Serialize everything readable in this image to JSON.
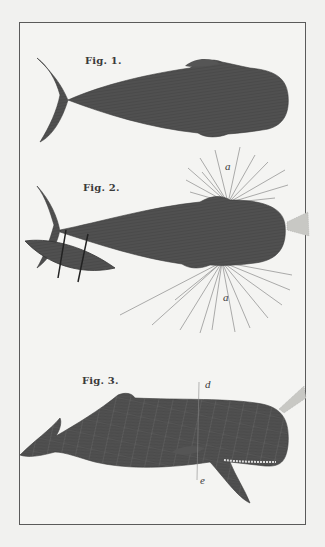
{
  "plate": {
    "figures": [
      {
        "id": "fig1",
        "label": "Fig. 1."
      },
      {
        "id": "fig2",
        "label": "Fig. 2.",
        "annotations": [
          "a",
          "a"
        ]
      },
      {
        "id": "fig3",
        "label": "Fig. 3.",
        "annotations": [
          "d",
          "e"
        ]
      }
    ]
  },
  "colors": {
    "paper": "#f1f1ef",
    "ink": "#3a3a3a",
    "whale": "#4a4a4a",
    "frame": "#5a5a5a"
  }
}
